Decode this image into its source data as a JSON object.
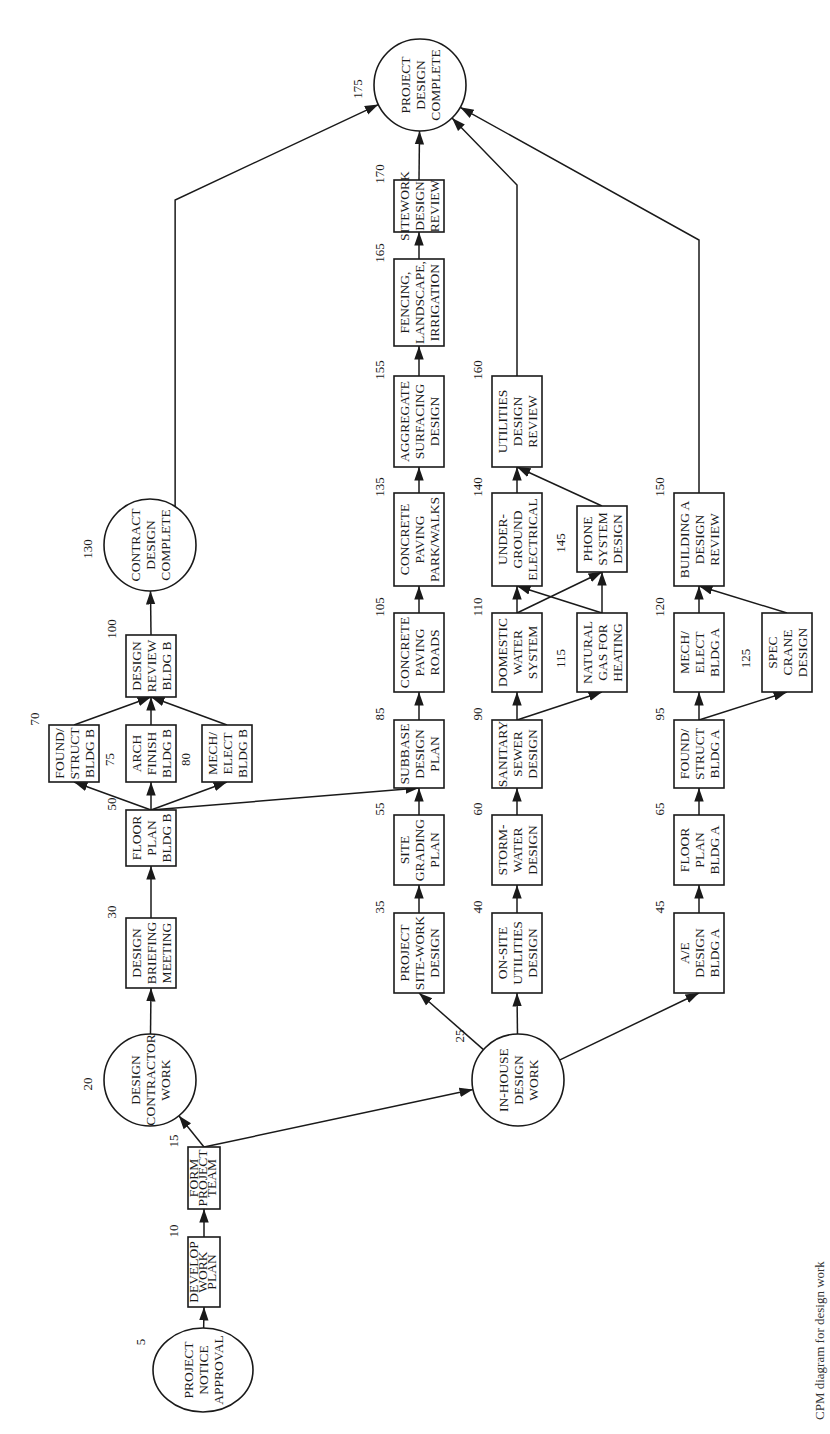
{
  "diagram": {
    "type": "activity-on-node network (CPM), rotated 90° counter-clockwise; flow runs bottom to top",
    "caption_fragment": "CPM diagram for design work",
    "nodes": [
      {
        "id": "5",
        "shape": "circle",
        "lines": [
          "PROJECT",
          "NOTICE",
          "APPROVAL"
        ],
        "cx": 203,
        "cy": 1370,
        "rx": 50,
        "ry": 42
      },
      {
        "id": "10",
        "shape": "box",
        "lines": [
          "DEVELOP",
          "WORK",
          "PLAN"
        ],
        "x": 188,
        "y": 1237,
        "w": 32,
        "h": 70
      },
      {
        "id": "15",
        "shape": "box",
        "lines": [
          "FORM",
          "PROJECT",
          "TEAM"
        ],
        "x": 188,
        "y": 1147,
        "w": 32,
        "h": 62
      },
      {
        "id": "20",
        "shape": "circle",
        "lines": [
          "DESIGN",
          "CONTRACTOR",
          "WORK"
        ],
        "cx": 150,
        "cy": 1080,
        "rx": 46,
        "ry": 46
      },
      {
        "id": "25",
        "shape": "circle",
        "lines": [
          "IN-HOUSE",
          "DESIGN",
          "WORK"
        ],
        "cx": 518,
        "cy": 1080,
        "rx": 46,
        "ry": 46
      },
      {
        "id": "30",
        "shape": "box",
        "lines": [
          "DESIGN",
          "BRIEFING",
          "MEETING"
        ],
        "x": 126,
        "y": 918,
        "w": 50,
        "h": 70
      },
      {
        "id": "35",
        "shape": "box",
        "lines": [
          "PROJECT",
          "SITE-WORK",
          "DESIGN"
        ],
        "x": 394,
        "y": 913,
        "w": 50,
        "h": 80
      },
      {
        "id": "40",
        "shape": "box",
        "lines": [
          "ON-SITE",
          "UTILITIES",
          "DESIGN"
        ],
        "x": 492,
        "y": 913,
        "w": 50,
        "h": 80
      },
      {
        "id": "45",
        "shape": "box",
        "lines": [
          "A/E",
          "DESIGN",
          "BLDG A"
        ],
        "x": 674,
        "y": 913,
        "w": 50,
        "h": 80
      },
      {
        "id": "50",
        "shape": "box",
        "lines": [
          "FLOOR",
          "PLAN",
          "BLDG B"
        ],
        "x": 126,
        "y": 810,
        "w": 50,
        "h": 56
      },
      {
        "id": "55",
        "shape": "box",
        "lines": [
          "SITE",
          "GRADING",
          "PLAN"
        ],
        "x": 394,
        "y": 815,
        "w": 50,
        "h": 70
      },
      {
        "id": "60",
        "shape": "box",
        "lines": [
          "STORM-",
          "WATER",
          "DESIGN"
        ],
        "x": 492,
        "y": 815,
        "w": 50,
        "h": 70
      },
      {
        "id": "65",
        "shape": "box",
        "lines": [
          "FLOOR",
          "PLAN",
          "BLDG A"
        ],
        "x": 674,
        "y": 815,
        "w": 50,
        "h": 70
      },
      {
        "id": "70",
        "shape": "box",
        "lines": [
          "FOUND/",
          "STRUCT",
          "BLDG B"
        ],
        "x": 49,
        "y": 725,
        "w": 50,
        "h": 57
      },
      {
        "id": "75",
        "shape": "box",
        "lines": [
          "ARCH",
          "FINISH",
          "BLDG B"
        ],
        "x": 126,
        "y": 725,
        "w": 50,
        "h": 57
      },
      {
        "id": "80",
        "shape": "box",
        "lines": [
          "MECH/",
          "ELECT",
          "BLDG B"
        ],
        "x": 202,
        "y": 725,
        "w": 50,
        "h": 57
      },
      {
        "id": "85",
        "shape": "box",
        "lines": [
          "SUBBASE",
          "DESIGN",
          "PLAN"
        ],
        "x": 394,
        "y": 720,
        "w": 50,
        "h": 68
      },
      {
        "id": "90",
        "shape": "box",
        "lines": [
          "SANITARY",
          "SEWER",
          "DESIGN"
        ],
        "x": 492,
        "y": 720,
        "w": 50,
        "h": 68
      },
      {
        "id": "95",
        "shape": "box",
        "lines": [
          "FOUND/",
          "STRUCT",
          "BLDG A"
        ],
        "x": 674,
        "y": 720,
        "w": 50,
        "h": 68
      },
      {
        "id": "100",
        "shape": "box",
        "lines": [
          "DESIGN",
          "REVIEW",
          "BLDG B"
        ],
        "x": 126,
        "y": 635,
        "w": 50,
        "h": 62
      },
      {
        "id": "105",
        "shape": "box",
        "lines": [
          "CONCRETE",
          "PAVING",
          "ROADS"
        ],
        "x": 394,
        "y": 613,
        "w": 50,
        "h": 79
      },
      {
        "id": "110",
        "shape": "box",
        "lines": [
          "DOMESTIC",
          "WATER",
          "SYSTEM"
        ],
        "x": 492,
        "y": 613,
        "w": 50,
        "h": 79
      },
      {
        "id": "115",
        "shape": "box",
        "lines": [
          "NATURAL",
          "GAS FOR",
          "HEATING"
        ],
        "x": 577,
        "y": 613,
        "w": 50,
        "h": 79
      },
      {
        "id": "120",
        "shape": "box",
        "lines": [
          "MECH/",
          "ELECT",
          "BLDG A"
        ],
        "x": 674,
        "y": 613,
        "w": 50,
        "h": 79
      },
      {
        "id": "125",
        "shape": "box",
        "lines": [
          "SPEC",
          "CRANE",
          "DESIGN"
        ],
        "x": 762,
        "y": 613,
        "w": 50,
        "h": 79
      },
      {
        "id": "130",
        "shape": "circle",
        "lines": [
          "CONTRACT",
          "DESIGN",
          "COMPLETE"
        ],
        "cx": 150,
        "cy": 545,
        "rx": 46,
        "ry": 46
      },
      {
        "id": "135",
        "shape": "box",
        "lines": [
          "CONCRETE",
          "PAVING",
          "PARK/WALKS"
        ],
        "x": 394,
        "y": 493,
        "w": 50,
        "h": 93
      },
      {
        "id": "140",
        "shape": "box",
        "lines": [
          "UNDER-",
          "GROUND",
          "ELECTRICAL"
        ],
        "x": 492,
        "y": 493,
        "w": 50,
        "h": 93
      },
      {
        "id": "145",
        "shape": "box",
        "lines": [
          "PHONE",
          "SYSTEM",
          "DESIGN"
        ],
        "x": 577,
        "y": 506,
        "w": 50,
        "h": 66
      },
      {
        "id": "150",
        "shape": "box",
        "lines": [
          "BUILDING A",
          "DESIGN",
          "REVIEW"
        ],
        "x": 674,
        "y": 493,
        "w": 50,
        "h": 93
      },
      {
        "id": "155",
        "shape": "box",
        "lines": [
          "AGGREGATE",
          "SURFACING",
          "DESIGN"
        ],
        "x": 394,
        "y": 376,
        "w": 50,
        "h": 91
      },
      {
        "id": "160",
        "shape": "box",
        "lines": [
          "UTILITIES",
          "DESIGN",
          "REVIEW"
        ],
        "x": 492,
        "y": 376,
        "w": 50,
        "h": 91
      },
      {
        "id": "165",
        "shape": "box",
        "lines": [
          "FENCING,",
          "LANDSCAPE,",
          "IRRIGATION"
        ],
        "x": 394,
        "y": 259,
        "w": 50,
        "h": 87
      },
      {
        "id": "170",
        "shape": "box",
        "lines": [
          "SITEWORK",
          "DESIGN",
          "REVIEW"
        ],
        "x": 394,
        "y": 180,
        "w": 50,
        "h": 52
      },
      {
        "id": "175",
        "shape": "circle",
        "lines": [
          "PROJECT",
          "DESIGN",
          "COMPLETE"
        ],
        "cx": 420,
        "cy": 85,
        "rx": 46,
        "ry": 46
      }
    ],
    "edges": [
      [
        "5",
        "10"
      ],
      [
        "10",
        "15"
      ],
      [
        "15",
        "20"
      ],
      [
        "15",
        "25"
      ],
      [
        "20",
        "30"
      ],
      [
        "30",
        "50"
      ],
      [
        "50",
        "70"
      ],
      [
        "50",
        "75"
      ],
      [
        "50",
        "80"
      ],
      [
        "50",
        "85"
      ],
      [
        "70",
        "100"
      ],
      [
        "75",
        "100"
      ],
      [
        "80",
        "100"
      ],
      [
        "100",
        "130"
      ],
      [
        "130",
        "175"
      ],
      [
        "25",
        "35"
      ],
      [
        "25",
        "40"
      ],
      [
        "25",
        "45"
      ],
      [
        "35",
        "55"
      ],
      [
        "55",
        "85"
      ],
      [
        "85",
        "105"
      ],
      [
        "105",
        "135"
      ],
      [
        "135",
        "155"
      ],
      [
        "155",
        "165"
      ],
      [
        "165",
        "170"
      ],
      [
        "170",
        "175"
      ],
      [
        "40",
        "60"
      ],
      [
        "60",
        "90"
      ],
      [
        "90",
        "110"
      ],
      [
        "90",
        "115"
      ],
      [
        "110",
        "140"
      ],
      [
        "110",
        "145"
      ],
      [
        "115",
        "140"
      ],
      [
        "115",
        "145"
      ],
      [
        "140",
        "160"
      ],
      [
        "145",
        "160"
      ],
      [
        "160",
        "175"
      ],
      [
        "45",
        "65"
      ],
      [
        "65",
        "95"
      ],
      [
        "95",
        "120"
      ],
      [
        "95",
        "125"
      ],
      [
        "120",
        "150"
      ],
      [
        "125",
        "150"
      ],
      [
        "150",
        "175"
      ]
    ]
  }
}
